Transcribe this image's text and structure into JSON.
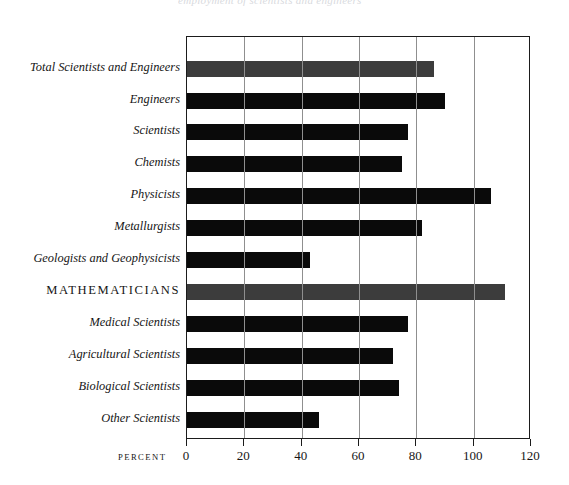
{
  "figure": {
    "clipped_title": "employment of scientists and engineers",
    "axis_title": "percent"
  },
  "chart_data": {
    "type": "bar",
    "orientation": "horizontal",
    "title": "",
    "xlabel": "PERCENT",
    "ylabel": "",
    "xlim": [
      0,
      120
    ],
    "xticks": [
      0,
      20,
      40,
      60,
      80,
      100,
      120
    ],
    "tick_labels": [
      "0",
      "20",
      "40",
      "60",
      "80",
      "100",
      "120"
    ],
    "grid": "vertical gridlines at every tick",
    "legend": "none",
    "highlight_category": "MATHEMATICIANS",
    "categories": [
      "Total Scientists and Engineers",
      "Engineers",
      "Scientists",
      "Chemists",
      "Physicists",
      "Metallurgists",
      "Geologists and Geophysicists",
      "MATHEMATICIANS",
      "Medical Scientists",
      "Agricultural Scientists",
      "Biological Scientists",
      "Other Scientists"
    ],
    "values": [
      86,
      90,
      77,
      75,
      106,
      82,
      43,
      111,
      77,
      72,
      74,
      46
    ],
    "bar_colors": [
      "#3c3c3c",
      "#0a0a0a",
      "#0a0a0a",
      "#0a0a0a",
      "#0a0a0a",
      "#0a0a0a",
      "#0a0a0a",
      "#3c3c3c",
      "#0a0a0a",
      "#0a0a0a",
      "#0a0a0a",
      "#0a0a0a"
    ],
    "emphasized": [
      true,
      false,
      false,
      false,
      false,
      false,
      false,
      true,
      false,
      false,
      false,
      false
    ]
  }
}
